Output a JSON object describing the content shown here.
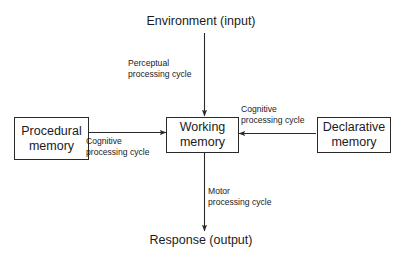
{
  "diagram": {
    "title_text": "Environment (input)",
    "output_text": "Response (output)",
    "nodes": [
      {
        "id": "procedural",
        "line1": "Procedural",
        "line2": "memory"
      },
      {
        "id": "working",
        "line1": "Working",
        "line2": "memory"
      },
      {
        "id": "declarative",
        "line1": "Declarative",
        "line2": "memory"
      }
    ],
    "edge_labels": [
      {
        "id": "perceptual",
        "line1": "Perceptual",
        "line2": "processing cycle"
      },
      {
        "id": "cognitive-left",
        "line1": "Cognitive",
        "line2": "processing cycle"
      },
      {
        "id": "cognitive-right",
        "line1": "Cognitive",
        "line2": "processing cycle"
      },
      {
        "id": "motor",
        "line1": "Motor",
        "line2": "processing cycle"
      }
    ],
    "colors": {
      "background": "#ffffff",
      "stroke": "#2a2a2a",
      "text": "#1b1b1b"
    }
  }
}
